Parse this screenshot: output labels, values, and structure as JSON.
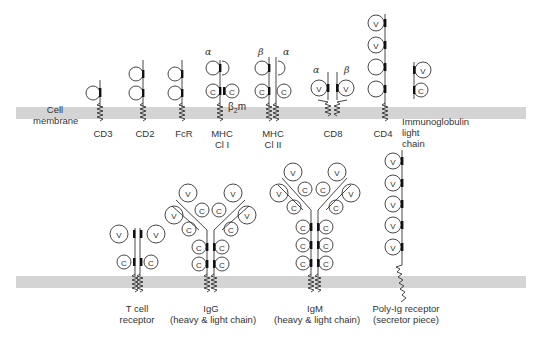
{
  "colors": {
    "membrane": "#d4d4d4",
    "line": "#333333",
    "text": "#333333",
    "bar": "#111111"
  },
  "membrane_label": {
    "line1": "Cell",
    "line2": "membrane"
  },
  "top_row": [
    {
      "id": "cd3",
      "label1": "CD3",
      "label2": ""
    },
    {
      "id": "cd2",
      "label1": "CD2",
      "label2": ""
    },
    {
      "id": "fcr",
      "label1": "FcR",
      "label2": ""
    },
    {
      "id": "mhc1",
      "label1": "MHC",
      "label2": "Cl I",
      "chain_alpha": "α",
      "beta2m": "β2m"
    },
    {
      "id": "mhc2",
      "label1": "MHC",
      "label2": "Cl II",
      "chain_beta": "β",
      "chain_alpha": "α"
    },
    {
      "id": "cd8",
      "label1": "CD8",
      "label2": "",
      "chain_alpha": "α",
      "chain_beta": "β"
    },
    {
      "id": "cd4",
      "label1": "CD4",
      "label2": ""
    },
    {
      "id": "iglight",
      "label1": "Immunoglobulin",
      "label2": "light",
      "label3": "chain"
    }
  ],
  "bottom_row": [
    {
      "id": "tcr",
      "label1": "T cell",
      "label2": "receptor"
    },
    {
      "id": "igg",
      "label1": "IgG",
      "label2": "(heavy & light chain)"
    },
    {
      "id": "igm",
      "label1": "IgM",
      "label2": "(heavy & light chain)"
    },
    {
      "id": "polyig",
      "label1": "Poly-Ig receptor",
      "label2": "(secretor piece)"
    }
  ],
  "domain_letters": {
    "variable": "V",
    "constant": "C"
  }
}
